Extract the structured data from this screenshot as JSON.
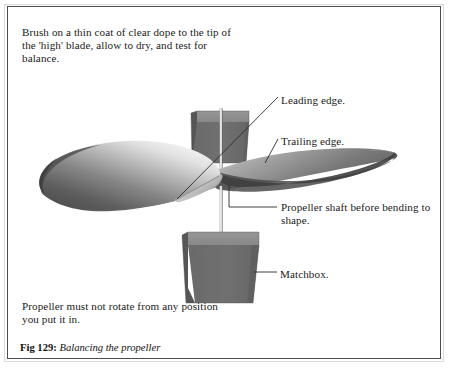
{
  "figure": {
    "caption_label": "Fig 129:",
    "caption_title": "Balancing the propeller",
    "instruction_top": "Brush on a thin coat of clear dope to the tip of the 'high' blade, allow to dry, and test for balance.",
    "instruction_bottom": "Propeller must not rotate from any position you put it in.",
    "callouts": [
      {
        "id": "leading-edge",
        "label": "Leading edge."
      },
      {
        "id": "trailing-edge",
        "label": "Trailing edge."
      },
      {
        "id": "propeller-shaft",
        "label": "Propeller shaft before bending to shape."
      },
      {
        "id": "matchbox",
        "label": "Matchbox."
      }
    ],
    "colors": {
      "page_background": "#ffffff",
      "frame_border": "#4a4a4f",
      "frame_outer_rule": "#d9d9d9",
      "text": "#1b1b1b",
      "leader_line": "#2b2b2b",
      "box_top_face": "#8c8c8c",
      "box_front_face": "#6e6e6e",
      "box_side_face": "#5d5d5d",
      "blade_dark": "#5a5a5a",
      "blade_light": "#f2f2f2",
      "blade_edge": "#3a3a3a",
      "shaft": "#e8e8e8"
    },
    "parts": [
      {
        "name": "left-propeller-blade"
      },
      {
        "name": "right-propeller-blade"
      },
      {
        "name": "upper-matchbox"
      },
      {
        "name": "lower-matchbox"
      },
      {
        "name": "propeller-shaft-line"
      }
    ]
  }
}
